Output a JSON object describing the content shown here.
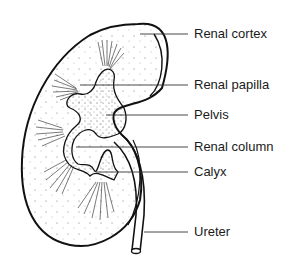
{
  "diagram": {
    "labels": [
      {
        "id": "renal-cortex",
        "text": "Renal cortex",
        "y": 34
      },
      {
        "id": "renal-papilla",
        "text": "Renal papilla",
        "y": 85
      },
      {
        "id": "pelvis",
        "text": "Pelvis",
        "y": 115
      },
      {
        "id": "renal-column",
        "text": "Renal column",
        "y": 147
      },
      {
        "id": "calyx",
        "text": "Calyx",
        "y": 172
      },
      {
        "id": "ureter",
        "text": "Ureter",
        "y": 232
      }
    ],
    "colors": {
      "ink": "#1a1a1a",
      "background": "#ffffff"
    }
  }
}
